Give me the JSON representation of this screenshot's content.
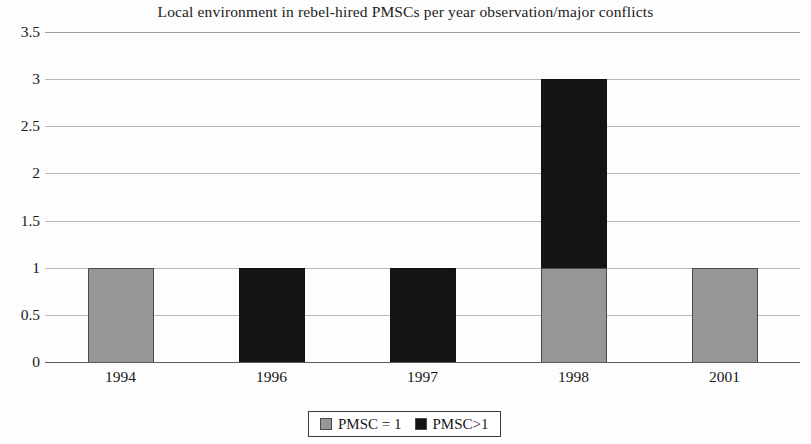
{
  "chart_data": {
    "type": "bar",
    "title": "Local environment in rebel-hired PMSCs per year observation/major conflicts",
    "xlabel": "",
    "ylabel": "",
    "categories": [
      "1994",
      "1996",
      "1997",
      "1998",
      "2001"
    ],
    "series": [
      {
        "name": "PMSC = 1",
        "color": "#969696",
        "values": [
          1,
          0,
          0,
          1,
          1
        ]
      },
      {
        "name": "PMSC>1",
        "color": "#141414",
        "values": [
          0,
          1,
          1,
          2,
          0
        ]
      }
    ],
    "stacked": true,
    "ylim": [
      0,
      3.5
    ],
    "yticks": [
      "0",
      "0.5",
      "1",
      "1.5",
      "2",
      "2.5",
      "3",
      "3.5"
    ],
    "ytick_values": [
      0,
      0.5,
      1,
      1.5,
      2,
      2.5,
      3,
      3.5
    ],
    "grid": true,
    "legend_position": "bottom"
  },
  "legend": {
    "entries": [
      {
        "label": "PMSC = 1",
        "swatch": "#969696"
      },
      {
        "label": "PMSC>1",
        "swatch": "#141414"
      }
    ]
  }
}
